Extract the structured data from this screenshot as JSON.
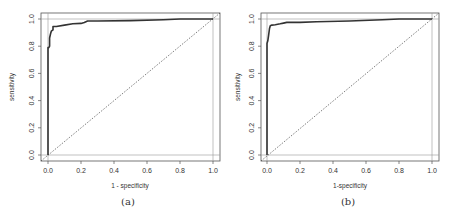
{
  "chart_data": [
    {
      "type": "line",
      "panel": "a",
      "caption": "(a)",
      "xlabel": "1 - specificity",
      "ylabel": "sensitivity",
      "xlim": [
        0,
        1
      ],
      "ylim": [
        0,
        1
      ],
      "xticks": [
        "0.0",
        "0.2",
        "0.4",
        "0.6",
        "0.8",
        "1.0"
      ],
      "yticks": [
        "0.0",
        "0.2",
        "0.4",
        "0.6",
        "0.8",
        "1.0"
      ],
      "reference_lines": {
        "h": [
          0,
          1
        ],
        "v": [
          0,
          1
        ]
      },
      "diagonal": "dashed y=x",
      "series": [
        {
          "name": "ROC curve",
          "x": [
            0.0,
            0.0,
            0.005,
            0.01,
            0.01,
            0.015,
            0.02,
            0.03,
            0.03,
            0.05,
            0.1,
            0.15,
            0.2,
            0.22,
            0.24,
            0.3,
            0.5,
            0.7,
            0.8,
            0.9,
            1.0
          ],
          "y": [
            0.0,
            0.79,
            0.79,
            0.8,
            0.86,
            0.89,
            0.91,
            0.92,
            0.945,
            0.945,
            0.955,
            0.965,
            0.968,
            0.975,
            0.985,
            0.985,
            0.988,
            0.995,
            1.0,
            1.0,
            1.0
          ]
        }
      ]
    },
    {
      "type": "line",
      "panel": "b",
      "caption": "(b)",
      "xlabel": "1-specificity",
      "ylabel": "sensitivity",
      "xlim": [
        0,
        1
      ],
      "ylim": [
        0,
        1
      ],
      "xticks": [
        "0.0",
        "0.2",
        "0.4",
        "0.6",
        "0.8",
        "1.0"
      ],
      "yticks": [
        "0.0",
        "0.2",
        "0.4",
        "0.6",
        "0.8",
        "1.0"
      ],
      "reference_lines": {
        "h": [
          0,
          1
        ],
        "v": [
          0,
          1
        ]
      },
      "diagonal": "dashed y=x",
      "series": [
        {
          "name": "ROC curve",
          "x": [
            0.0,
            0.0,
            0.005,
            0.01,
            0.015,
            0.02,
            0.03,
            0.05,
            0.08,
            0.1,
            0.12,
            0.2,
            0.3,
            0.5,
            0.7,
            0.8,
            1.0
          ],
          "y": [
            0.0,
            0.82,
            0.84,
            0.88,
            0.93,
            0.95,
            0.955,
            0.958,
            0.965,
            0.97,
            0.975,
            0.975,
            0.98,
            0.985,
            0.995,
            1.0,
            1.0
          ]
        }
      ]
    }
  ],
  "panels": [
    {
      "caption": "(a)",
      "xlabel": "1 - specificity",
      "ylabel": "sensitivity"
    },
    {
      "caption": "(b)",
      "xlabel": "1-specificity",
      "ylabel": "sensitivity"
    }
  ],
  "ticks": [
    "0.0",
    "0.2",
    "0.4",
    "0.6",
    "0.8",
    "1.0"
  ]
}
